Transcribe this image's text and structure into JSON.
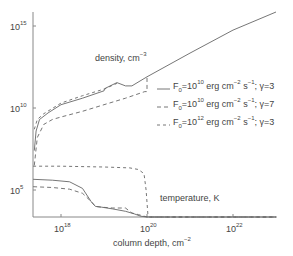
{
  "chart_data": {
    "type": "line",
    "title": "",
    "xlabel": "column depth, cm^-2",
    "xlabel_parts": {
      "text": "column depth, cm",
      "sup": "−2"
    },
    "ylabel": "",
    "xscale": "log",
    "yscale": "log",
    "xlim_log10": [
      17.35,
      23.0
    ],
    "ylim_log10": [
      3.35,
      15.85
    ],
    "x_ticks": [
      {
        "base": "10",
        "exp": "18",
        "log": 18
      },
      {
        "base": "10",
        "exp": "20",
        "log": 20
      },
      {
        "base": "10",
        "exp": "22",
        "log": 22
      }
    ],
    "y_ticks": [
      {
        "base": "10",
        "exp": "5",
        "log": 5
      },
      {
        "base": "10",
        "exp": "10",
        "log": 10
      },
      {
        "base": "10",
        "exp": "15",
        "log": 15
      }
    ],
    "grid": false,
    "legend_position": "right-middle",
    "annotations": [
      {
        "id": "density",
        "text": "density, cm",
        "sup": "−3"
      },
      {
        "id": "temperature",
        "text": "temperature, K",
        "sup": ""
      }
    ],
    "series": [
      {
        "name": "F0=10^10 erg cm^-2 s^-1; γ=3",
        "legend": {
          "F": "F",
          "sub": "0",
          "eq": "=10",
          "exp1": "10",
          "unit": " erg cm",
          "exp2": "−2",
          "s": " s",
          "exp3": "−1",
          "gamma": "; γ=3"
        },
        "style": "solid",
        "density_log10": {
          "x": [
            17.38,
            17.42,
            17.5,
            17.7,
            18.0,
            18.5,
            19.0,
            19.03,
            19.3,
            19.5,
            19.65,
            20.0,
            21.0,
            22.0,
            23.0
          ],
          "y": [
            7.4,
            8.6,
            9.3,
            9.7,
            10.2,
            10.6,
            11.05,
            11.2,
            11.55,
            11.35,
            11.35,
            11.9,
            13.35,
            14.75,
            16.1
          ]
        },
        "temperature_log10": {
          "x": [
            17.35,
            17.8,
            18.2,
            18.5,
            18.7,
            18.8,
            18.95,
            19.2,
            19.5,
            19.7,
            19.85,
            20.0,
            20.3,
            20.5,
            21.0,
            22.0,
            23.0
          ],
          "y": [
            5.65,
            5.6,
            5.5,
            5.1,
            4.3,
            4.0,
            3.95,
            3.85,
            3.7,
            3.55,
            3.4,
            3.3,
            3.2,
            3.15,
            3.15,
            3.15,
            3.15
          ]
        }
      },
      {
        "name": "F0=10^10 erg cm^-2 s^-1; γ=7",
        "legend": {
          "F": "F",
          "sub": "0",
          "eq": "=10",
          "exp1": "10",
          "unit": " erg cm",
          "exp2": "−2",
          "s": " s",
          "exp3": "−1",
          "gamma": "; γ=7"
        },
        "style": "dashed",
        "density_log10": {
          "x": [
            17.38,
            17.45,
            17.6,
            17.8,
            18.0,
            18.5,
            19.0,
            19.5,
            19.95,
            20.0,
            20.0
          ],
          "y": [
            6.5,
            8.2,
            9.0,
            9.3,
            9.45,
            9.8,
            10.2,
            10.6,
            11.0,
            11.0,
            12.0
          ]
        },
        "temperature_log10": {
          "x": [
            17.35,
            17.8,
            18.2,
            18.5,
            18.7,
            18.8,
            18.95,
            19.2,
            19.5,
            19.65,
            19.8,
            20.0,
            20.5,
            23.0
          ],
          "y": [
            5.2,
            5.15,
            5.05,
            4.8,
            4.3,
            4.0,
            3.95,
            3.9,
            3.9,
            3.6,
            3.5,
            3.3,
            3.15,
            3.15
          ]
        }
      },
      {
        "name": "F0=10^12 erg cm^-2 s^-1; γ=3",
        "legend": {
          "F": "F",
          "sub": "0",
          "eq": "=10",
          "exp1": "12",
          "unit": " erg cm",
          "exp2": "−2",
          "s": " s",
          "exp3": "−1",
          "gamma": "; γ=3"
        },
        "style": "dashdot",
        "density_log10": {
          "x": [
            17.38,
            17.45,
            17.6,
            18.0,
            18.5,
            19.0,
            19.3
          ],
          "y": [
            8.7,
            9.3,
            9.65,
            10.3,
            10.75,
            11.15,
            11.5
          ]
        },
        "temperature_log10": {
          "x": [
            17.35,
            18.0,
            19.0,
            19.6,
            19.8,
            19.93,
            19.98,
            20.02,
            20.05,
            23.0
          ],
          "y": [
            6.45,
            6.45,
            6.4,
            6.35,
            6.25,
            6.0,
            5.0,
            3.5,
            3.15,
            3.15
          ]
        }
      }
    ]
  },
  "colors": {
    "axis": "#888888",
    "line": "#666666",
    "text": "#444444",
    "background": "#ffffff"
  }
}
